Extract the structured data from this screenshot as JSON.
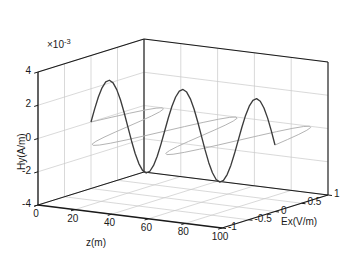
{
  "figure": {
    "background_color": "#ffffff",
    "axis_color": "#1a1a1a",
    "grid_color": "#c8c8c8"
  },
  "axes": {
    "y": {
      "label": "Hy(A/m)",
      "exponent_label": "×10⁻³",
      "exponent_mantissa": "×10",
      "exponent_power": "-3",
      "ticks": [
        "4",
        "2",
        "0",
        "-2",
        "-4"
      ],
      "values": [
        4,
        2,
        0,
        -2,
        -4
      ],
      "lim": [
        -4,
        4
      ],
      "scale": 0.001
    },
    "z": {
      "label": "z(m)",
      "ticks": [
        "0",
        "20",
        "40",
        "60",
        "80",
        "100"
      ],
      "values": [
        0,
        20,
        40,
        60,
        80,
        100
      ],
      "lim": [
        0,
        100
      ]
    },
    "x": {
      "label": "Ex(V/m)",
      "ticks": [
        "-1",
        "-0.5",
        "0",
        "0.5",
        "1"
      ],
      "values": [
        -1,
        -0.5,
        0,
        0.5,
        1
      ],
      "lim": [
        -1,
        1
      ]
    }
  },
  "chart_data": {
    "type": "line",
    "title": "",
    "xlabel": "z(m)",
    "ylabel": "Hy(A/m)",
    "zlabel": "Ex(V/m)",
    "xlim": [
      0,
      100
    ],
    "ylim": [
      -4,
      4
    ],
    "zlim": [
      -1,
      1
    ],
    "grid": true,
    "legend": "none",
    "projection": "3d",
    "series": [
      {
        "name": "Hy",
        "color": "#3c3c3c",
        "plane": "vertical",
        "axis": "Hy(A/m)",
        "unit": "A/m",
        "scale": 0.001,
        "amplitude": 2.65,
        "wavelength": 25,
        "cycles": 4,
        "phase_deg": 0,
        "x": [
          0,
          2,
          4,
          6,
          8,
          10,
          12,
          14,
          16,
          18,
          20,
          22,
          24,
          26,
          28,
          30,
          32,
          34,
          36,
          38,
          40,
          42,
          44,
          46,
          48,
          50,
          52,
          54,
          56,
          58,
          60,
          62,
          64,
          66,
          68,
          70,
          72,
          74,
          76,
          78,
          80,
          82,
          84,
          86,
          88,
          90,
          92,
          94,
          96,
          98,
          100
        ],
        "values": [
          0,
          0.82,
          1.56,
          2.14,
          2.52,
          2.65,
          2.52,
          2.14,
          1.56,
          0.82,
          0,
          -0.82,
          -1.56,
          -2.14,
          -2.52,
          -2.65,
          -2.52,
          -2.14,
          -1.56,
          -0.82,
          0,
          0.82,
          1.56,
          2.14,
          2.52,
          2.65,
          2.52,
          2.14,
          1.56,
          0.82,
          0,
          -0.82,
          -1.56,
          -2.14,
          -2.52,
          -2.65,
          -2.52,
          -2.14,
          -1.56,
          -0.82,
          0,
          0.82,
          1.56,
          2.14,
          2.52,
          2.65,
          2.52,
          2.14,
          1.56,
          0.82,
          0
        ]
      },
      {
        "name": "Ex",
        "color": "#b4b4b4",
        "plane": "horizontal",
        "axis": "Ex(V/m)",
        "unit": "V/m",
        "amplitude": 1.0,
        "wavelength": 25,
        "cycles": 4,
        "phase_deg": 0,
        "x": [
          0,
          2,
          4,
          6,
          8,
          10,
          12,
          14,
          16,
          18,
          20,
          22,
          24,
          26,
          28,
          30,
          32,
          34,
          36,
          38,
          40,
          42,
          44,
          46,
          48,
          50,
          52,
          54,
          56,
          58,
          60,
          62,
          64,
          66,
          68,
          70,
          72,
          74,
          76,
          78,
          80,
          82,
          84,
          86,
          88,
          90,
          92,
          94,
          96,
          98,
          100
        ],
        "values": [
          0,
          0.309,
          0.588,
          0.809,
          0.951,
          1.0,
          0.951,
          0.809,
          0.588,
          0.309,
          0,
          -0.309,
          -0.588,
          -0.809,
          -0.951,
          -1.0,
          -0.951,
          -0.809,
          -0.588,
          -0.309,
          0,
          0.309,
          0.588,
          0.809,
          0.951,
          1.0,
          0.951,
          0.809,
          0.588,
          0.309,
          0,
          -0.309,
          -0.588,
          -0.809,
          -0.951,
          -1.0,
          -0.951,
          -0.809,
          -0.588,
          -0.309,
          0,
          0.309,
          0.588,
          0.809,
          0.951,
          1.0,
          0.951,
          0.809,
          0.588,
          0.309,
          0
        ]
      }
    ]
  }
}
